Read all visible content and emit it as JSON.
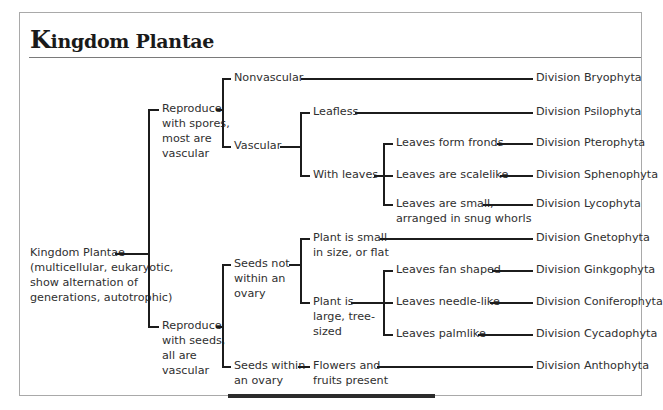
{
  "title": {
    "cap": "K",
    "rest": "ingdom Plantae"
  },
  "root": {
    "lines": [
      "Kingdom Plantae",
      "(multicellular, eukaryotic,",
      "show alternation of",
      "generations, autotrophic)"
    ]
  },
  "branches": {
    "spores": {
      "lines": [
        "Reproduce",
        "with spores,",
        "most are",
        "vascular"
      ],
      "nonvascular": {
        "label": "Nonvascular",
        "division": "Division Bryophyta"
      },
      "vascular": {
        "label": "Vascular",
        "leafless": {
          "label": "Leafless",
          "division": "Division Psilophyta"
        },
        "with_leaves": {
          "label": "With leaves",
          "fronds": {
            "label": "Leaves form fronds",
            "division": "Division Pterophyta"
          },
          "scalelike": {
            "label": "Leaves are scalelike",
            "division": "Division Sphenophyta"
          },
          "small": {
            "lines": [
              "Leaves are small,",
              "arranged in snug whorls"
            ],
            "division": "Division Lycophyta"
          }
        }
      }
    },
    "seeds": {
      "lines": [
        "Reproduce",
        "with seeds,",
        "all are",
        "vascular"
      ],
      "not_in_ovary": {
        "lines": [
          "Seeds not",
          "within an",
          "ovary"
        ],
        "small_plant": {
          "lines": [
            "Plant is small",
            "in size, or flat"
          ],
          "division": "Division Gnetophyta"
        },
        "large_plant": {
          "lines": [
            "Plant is",
            "large, tree-",
            "sized"
          ],
          "fan": {
            "label": "Leaves fan shaped",
            "division": "Division Ginkgophyta"
          },
          "needle": {
            "label": "Leaves needle-like",
            "division": "Division Coniferophyta"
          },
          "palm": {
            "label": "Leaves palmlike",
            "division": "Division Cycadophyta"
          }
        }
      },
      "in_ovary": {
        "lines": [
          "Seeds within",
          "an ovary"
        ],
        "flowers": {
          "lines": [
            "Flowers and",
            "fruits present"
          ],
          "division": "Division Anthophyta"
        }
      }
    }
  },
  "colors": {
    "line": "#1c1c1c",
    "text": "#2f2f2f",
    "border": "#a9a9a9"
  }
}
